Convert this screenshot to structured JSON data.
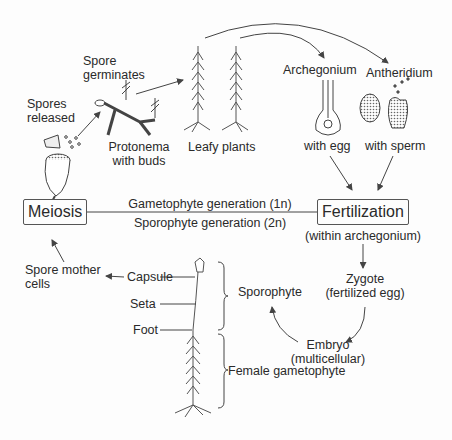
{
  "diagram": {
    "nodes": {
      "spores_released": "Spores\nreleased",
      "spores_released_l1": "Spores",
      "spores_released_l2": "released",
      "spore_germinates_l1": "Spore",
      "spore_germinates_l2": "germinates",
      "protonema_l1": "Protonema",
      "protonema_l2": "with buds",
      "leafy_plants": "Leafy plants",
      "archegonium": "Archegonium",
      "archegonium_sub": "with egg",
      "antheridium": "Antheridium",
      "antheridium_sub": "with sperm",
      "meiosis": "Meiosis",
      "fertilization": "Fertilization",
      "fertilization_sub": "(within archegonium)",
      "gametophyte_generation": "Gametophyte generation (1n)",
      "sporophyte_generation": "Sporophyte generation (2n)",
      "zygote_l1": "Zygote",
      "zygote_l2": "(fertilized egg)",
      "embryo_l1": "Embryo",
      "embryo_l2": "(multicellular)",
      "sporophyte": "Sporophyte",
      "spore_mother_cells_l1": "Spore mother",
      "spore_mother_cells_l2": "cells",
      "capsule": "Capsule",
      "seta": "Seta",
      "foot": "Foot",
      "female_gametophyte": "Female gametophyte"
    },
    "colors": {
      "line": "#444444",
      "text": "#2a2a2a",
      "background": "#fdfdfd"
    }
  }
}
